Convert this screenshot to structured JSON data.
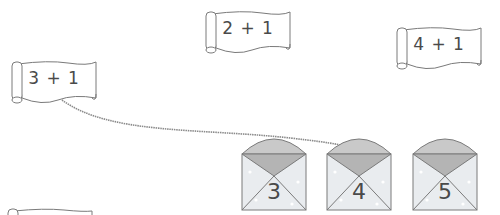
{
  "scrolls": [
    {
      "id": "scroll-left",
      "label": "3 + 1",
      "x": 8,
      "y": 58,
      "w": 92,
      "h": 48
    },
    {
      "id": "scroll-middle",
      "label": "2 + 1",
      "x": 202,
      "y": 8,
      "w": 92,
      "h": 48
    },
    {
      "id": "scroll-right",
      "label": "4 + 1",
      "x": 393,
      "y": 24,
      "w": 92,
      "h": 48
    },
    {
      "id": "scroll-bottom",
      "label": "",
      "x": 4,
      "y": 208,
      "w": 92,
      "h": 40
    }
  ],
  "envelopes": [
    {
      "id": "envelope-3",
      "number": "3",
      "x": 240,
      "y": 134
    },
    {
      "id": "envelope-4",
      "number": "4",
      "x": 325,
      "y": 134
    },
    {
      "id": "envelope-5",
      "number": "5",
      "x": 411,
      "y": 134
    }
  ],
  "connection": {
    "from": "scroll-left",
    "to": "envelope-4"
  },
  "colors": {
    "envelope_flap": "#c9c9c9",
    "envelope_inner": "#b4b4b4",
    "envelope_body": "#e9ecef",
    "outline": "#7a7a7a",
    "connector": "#8a8a8a",
    "text": "#4a4a4a"
  }
}
